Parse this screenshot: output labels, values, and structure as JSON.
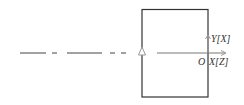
{
  "diagram": {
    "labels": {
      "y_axis": "Y[X]",
      "x_axis": "X[Z]",
      "origin": "O"
    },
    "colors": {
      "line": "#333333",
      "axis_arrow": "#999999",
      "background": "#ffffff"
    }
  }
}
